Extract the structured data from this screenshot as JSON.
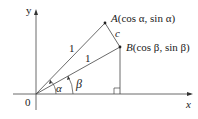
{
  "diagram": {
    "axes": {
      "x_label": "x",
      "y_label": "y",
      "origin_label": "0"
    },
    "points": {
      "A": {
        "name": "A",
        "coords": "(cos α, sin α)"
      },
      "B": {
        "name": "B",
        "coords": "(cos β, sin β)"
      }
    },
    "segments": {
      "OA_length": "1",
      "OB_length": "1",
      "AB_label": "c"
    },
    "angles": {
      "alpha": "α",
      "beta": "β"
    },
    "colors": {
      "line": "#444444",
      "text": "#222222"
    }
  }
}
